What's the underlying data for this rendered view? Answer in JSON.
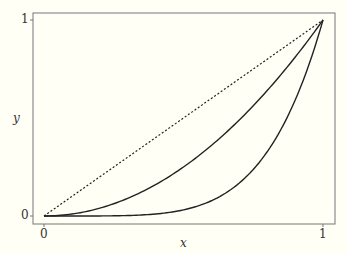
{
  "chart_data": {
    "type": "line",
    "title": "",
    "xlabel": "x",
    "ylabel": "y",
    "xlim": [
      0,
      1
    ],
    "ylim": [
      0,
      1
    ],
    "xticks": [
      "0",
      "1"
    ],
    "yticks": [
      "0",
      "1"
    ],
    "grid": false,
    "series": [
      {
        "name": "y = x",
        "style": "dotted",
        "x": [
          0,
          1
        ],
        "y": [
          0,
          1
        ]
      },
      {
        "name": "y = x^2",
        "style": "solid",
        "x": [
          0,
          0.25,
          0.5,
          0.75,
          1
        ],
        "y": [
          0,
          0.0625,
          0.25,
          0.5625,
          1
        ]
      },
      {
        "name": "y = x^5",
        "style": "solid",
        "x": [
          0,
          0.25,
          0.5,
          0.75,
          1
        ],
        "y": [
          0,
          0.001,
          0.031,
          0.237,
          1
        ]
      }
    ]
  },
  "axes": {
    "x_label": "x",
    "y_label": "y",
    "x_tick_0": "0",
    "x_tick_1": "1",
    "y_tick_0": "0",
    "y_tick_1": "1"
  }
}
